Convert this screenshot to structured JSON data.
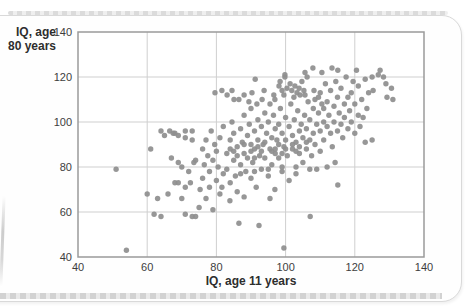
{
  "page": {
    "background": "#ffffff",
    "card_border_color": "#d9d9d9"
  },
  "chart_data": {
    "type": "scatter",
    "title": "",
    "xlabel": "IQ, age 11 years",
    "ylabel_line1": "IQ, age",
    "ylabel_line2": "80 years",
    "xlim": [
      40,
      140
    ],
    "ylim": [
      40,
      140
    ],
    "x_ticks": [
      40,
      60,
      80,
      100,
      120,
      140
    ],
    "y_ticks": [
      40,
      60,
      80,
      100,
      120,
      140
    ],
    "grid": true,
    "legend": "none",
    "point_color": "#8e8e8e",
    "grid_color": "#cfcfcf",
    "axis_color": "#9a9a9a",
    "points": [
      [
        51,
        79
      ],
      [
        54,
        43
      ],
      [
        60,
        68
      ],
      [
        61,
        88
      ],
      [
        62,
        59
      ],
      [
        63,
        66
      ],
      [
        64,
        58
      ],
      [
        64,
        96
      ],
      [
        65,
        94
      ],
      [
        66.5,
        96
      ],
      [
        67,
        84
      ],
      [
        67.5,
        95
      ],
      [
        66,
        68
      ],
      [
        68,
        95
      ],
      [
        69,
        94
      ],
      [
        69,
        82
      ],
      [
        70,
        80
      ],
      [
        71,
        96
      ],
      [
        71,
        93
      ],
      [
        72,
        78
      ],
      [
        72.5,
        73
      ],
      [
        73,
        96
      ],
      [
        73,
        92
      ],
      [
        74,
        83
      ],
      [
        73.5,
        82
      ],
      [
        68,
        73
      ],
      [
        69,
        73
      ],
      [
        71,
        71
      ],
      [
        71,
        59
      ],
      [
        73,
        58
      ],
      [
        74,
        58
      ],
      [
        70,
        66
      ],
      [
        75,
        62
      ],
      [
        75.3,
        70
      ],
      [
        76,
        75
      ],
      [
        76,
        88
      ],
      [
        76.5,
        81
      ],
      [
        77,
        66
      ],
      [
        77,
        92
      ],
      [
        77.5,
        85
      ],
      [
        78,
        71
      ],
      [
        78,
        78
      ],
      [
        78.5,
        96
      ],
      [
        79,
        61
      ],
      [
        79,
        83
      ],
      [
        79.5,
        90
      ],
      [
        80,
        74
      ],
      [
        80,
        87
      ],
      [
        80.5,
        80
      ],
      [
        81,
        68
      ],
      [
        81,
        93
      ],
      [
        81.6,
        71
      ],
      [
        82,
        77
      ],
      [
        82,
        98
      ],
      [
        79.6,
        113
      ],
      [
        81.6,
        114
      ],
      [
        83.1,
        112
      ],
      [
        84.5,
        114
      ],
      [
        85.1,
        110
      ],
      [
        86.5,
        110
      ],
      [
        83,
        86
      ],
      [
        83,
        79
      ],
      [
        83.9,
        65
      ],
      [
        84,
        92
      ],
      [
        84,
        73
      ],
      [
        84.5,
        100
      ],
      [
        85,
        83
      ],
      [
        85,
        95
      ],
      [
        85.5,
        76
      ],
      [
        86,
        89
      ],
      [
        86,
        69
      ],
      [
        86.5,
        55
      ],
      [
        87,
        97
      ],
      [
        87,
        81
      ],
      [
        87.5,
        91
      ],
      [
        88,
        66.7
      ],
      [
        88,
        86
      ],
      [
        88,
        103
      ],
      [
        88.5,
        78
      ],
      [
        89,
        94
      ],
      [
        89,
        84
      ],
      [
        89.5,
        99
      ],
      [
        90,
        75
      ],
      [
        90,
        90
      ],
      [
        90,
        106
      ],
      [
        88,
        112
      ],
      [
        89.4,
        109
      ],
      [
        90.3,
        113
      ],
      [
        91.2,
        119
      ],
      [
        91.7,
        108
      ],
      [
        93.2,
        110
      ],
      [
        93.8,
        114
      ],
      [
        90.5,
        82
      ],
      [
        91,
        96
      ],
      [
        91,
        88
      ],
      [
        91.5,
        71
      ],
      [
        92,
        101
      ],
      [
        92,
        92
      ],
      [
        92.3,
        54
      ],
      [
        92.5,
        85
      ],
      [
        93,
        98
      ],
      [
        93,
        79
      ],
      [
        93.5,
        90
      ],
      [
        94,
        104
      ],
      [
        94,
        84
      ],
      [
        94.5,
        95
      ],
      [
        95,
        76
      ],
      [
        95,
        100
      ],
      [
        95.5,
        66
      ],
      [
        95.5,
        88
      ],
      [
        96,
        93
      ],
      [
        96,
        81
      ],
      [
        96.5,
        103
      ],
      [
        96.9,
        70
      ],
      [
        97,
        97
      ],
      [
        97,
        86
      ],
      [
        95.5,
        108
      ],
      [
        96.6,
        112
      ],
      [
        96.9,
        110
      ],
      [
        98.1,
        116
      ],
      [
        98.4,
        118
      ],
      [
        99,
        114
      ],
      [
        99.5,
        112
      ],
      [
        99.8,
        120
      ],
      [
        100.4,
        115
      ],
      [
        99.8,
        121
      ],
      [
        97.5,
        92
      ],
      [
        98,
        99
      ],
      [
        98,
        84
      ],
      [
        98.5,
        106
      ],
      [
        99,
        95
      ],
      [
        99,
        78
      ],
      [
        99.5,
        44
      ],
      [
        99.5,
        89
      ],
      [
        100,
        102
      ],
      [
        100,
        92
      ],
      [
        100.5,
        85
      ],
      [
        101,
        98
      ],
      [
        101,
        74
      ],
      [
        101.5,
        108
      ],
      [
        102,
        94
      ],
      [
        102,
        88
      ],
      [
        102.5,
        101
      ],
      [
        103,
        91
      ],
      [
        103,
        80
      ],
      [
        103.5,
        105
      ],
      [
        104,
        96
      ],
      [
        104,
        86
      ],
      [
        104.5,
        99
      ],
      [
        101.3,
        117
      ],
      [
        101.8,
        114
      ],
      [
        102.4,
        111
      ],
      [
        102.7,
        116
      ],
      [
        103.3,
        113
      ],
      [
        103.9,
        115
      ],
      [
        104.2,
        112
      ],
      [
        104.7,
        118
      ],
      [
        105.3,
        114
      ],
      [
        105.6,
        112
      ],
      [
        105.6,
        122
      ],
      [
        106.2,
        120
      ],
      [
        105,
        93
      ],
      [
        105,
        82
      ],
      [
        105.5,
        103
      ],
      [
        106,
        97
      ],
      [
        106,
        88
      ],
      [
        106.5,
        109
      ],
      [
        107,
        101
      ],
      [
        107,
        92
      ],
      [
        107.1,
        58
      ],
      [
        107.5,
        85
      ],
      [
        107.9,
        124
      ],
      [
        108,
        106
      ],
      [
        108,
        95
      ],
      [
        108.2,
        114
      ],
      [
        108.5,
        110
      ],
      [
        108.5,
        90
      ],
      [
        109,
        99
      ],
      [
        109,
        79
      ],
      [
        109.5,
        104
      ],
      [
        110,
        96
      ],
      [
        110,
        87
      ],
      [
        110.5,
        122
      ],
      [
        110.5,
        108
      ],
      [
        111,
        100
      ],
      [
        111,
        92
      ],
      [
        109.5,
        111
      ],
      [
        110,
        113
      ],
      [
        111,
        106
      ],
      [
        111.5,
        117
      ],
      [
        112,
        80
      ],
      [
        112,
        98
      ],
      [
        112,
        109
      ],
      [
        112.5,
        103
      ],
      [
        113,
        95
      ],
      [
        113,
        114
      ],
      [
        113.4,
        124
      ],
      [
        113.5,
        89
      ],
      [
        114,
        107
      ],
      [
        114,
        100
      ],
      [
        114.3,
        82
      ],
      [
        114.5,
        118
      ],
      [
        115,
        111
      ],
      [
        115,
        96
      ],
      [
        115.1,
        72
      ],
      [
        115.1,
        123
      ],
      [
        115.5,
        104
      ],
      [
        116,
        99
      ],
      [
        116,
        115
      ],
      [
        116.5,
        93
      ],
      [
        117,
        108
      ],
      [
        117,
        102
      ],
      [
        117.5,
        120
      ],
      [
        118,
        97
      ],
      [
        118,
        111
      ],
      [
        118.5,
        105
      ],
      [
        119,
        100
      ],
      [
        119,
        113
      ],
      [
        119.5,
        118
      ],
      [
        120,
        95
      ],
      [
        120,
        108
      ],
      [
        120.5,
        123
      ],
      [
        121,
        103
      ],
      [
        121,
        116
      ],
      [
        121.5,
        98
      ],
      [
        122,
        110
      ],
      [
        122.4,
        102
      ],
      [
        123,
        91
      ],
      [
        123,
        119
      ],
      [
        123.5,
        106
      ],
      [
        124,
        113
      ],
      [
        125,
        92
      ],
      [
        125,
        120
      ],
      [
        125.3,
        114
      ],
      [
        126.8,
        121
      ],
      [
        127.3,
        123
      ],
      [
        128.3,
        120
      ],
      [
        129.3,
        111
      ],
      [
        130.6,
        115
      ],
      [
        131,
        110
      ],
      [
        129,
        117
      ],
      [
        84,
        88
      ],
      [
        86,
        85
      ],
      [
        88,
        90
      ],
      [
        90,
        87
      ],
      [
        92,
        89
      ],
      [
        94,
        91
      ],
      [
        96,
        87
      ],
      [
        98,
        90
      ],
      [
        100,
        88
      ],
      [
        102,
        90
      ],
      [
        104,
        89
      ],
      [
        106,
        91
      ],
      [
        85,
        87
      ],
      [
        91,
        84
      ],
      [
        97,
        88
      ],
      [
        103,
        87
      ],
      [
        99,
        86
      ],
      [
        93,
        87
      ],
      [
        87,
        77
      ],
      [
        91,
        78
      ],
      [
        95,
        79
      ],
      [
        99,
        80
      ],
      [
        103,
        77
      ],
      [
        107,
        79
      ]
    ]
  }
}
